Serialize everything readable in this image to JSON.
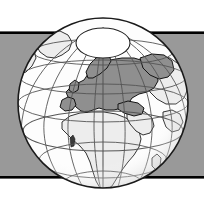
{
  "figure": {
    "kind": "locator-globe-map",
    "title": "Orthographic globe locator map centred on Europe",
    "width": 204,
    "height": 204,
    "background_color": "#ffffff"
  },
  "banner": {
    "name": "horizontal-grey-band",
    "fill_color": "#999999",
    "top_y": 34,
    "bottom_y": 177,
    "rule_color": "#000000",
    "rule_thickness": 2.6
  },
  "globe": {
    "center_x": 103,
    "center_y": 103,
    "radius": 85,
    "ocean_color": "#fdfdfd",
    "outline_color": "#1a1a1a",
    "outline_width": 1.6,
    "graticule_color": "#555555",
    "graticule_width": 0.9,
    "projection": "orthographic",
    "center_longitude_deg": 20,
    "center_latitude_deg": 35,
    "meridian_step_deg": 20,
    "parallel_step_deg": 20
  },
  "polar_cap": {
    "name": "north-polar-cap",
    "cx": 103,
    "cy": 43,
    "rx": 27,
    "ry": 15,
    "fill_color": "#ffffff",
    "stroke_color": "#222222"
  },
  "land": {
    "base_color": "#ededed",
    "outline_color": "#1d1d1d",
    "outline_width": 0.9
  },
  "highlight": {
    "name": "europe-highlight",
    "label": "Europe",
    "fill_color": "#8f8f8f",
    "outline_color": "#141414"
  },
  "legend": {
    "highlighted_region": "Europe",
    "other_regions": [
      "Africa",
      "Arabia",
      "Greenland",
      "Asia",
      "North America"
    ]
  },
  "shadow": {
    "name": "limb-shading",
    "color": "#c9c9c9",
    "opacity": 0.55
  }
}
